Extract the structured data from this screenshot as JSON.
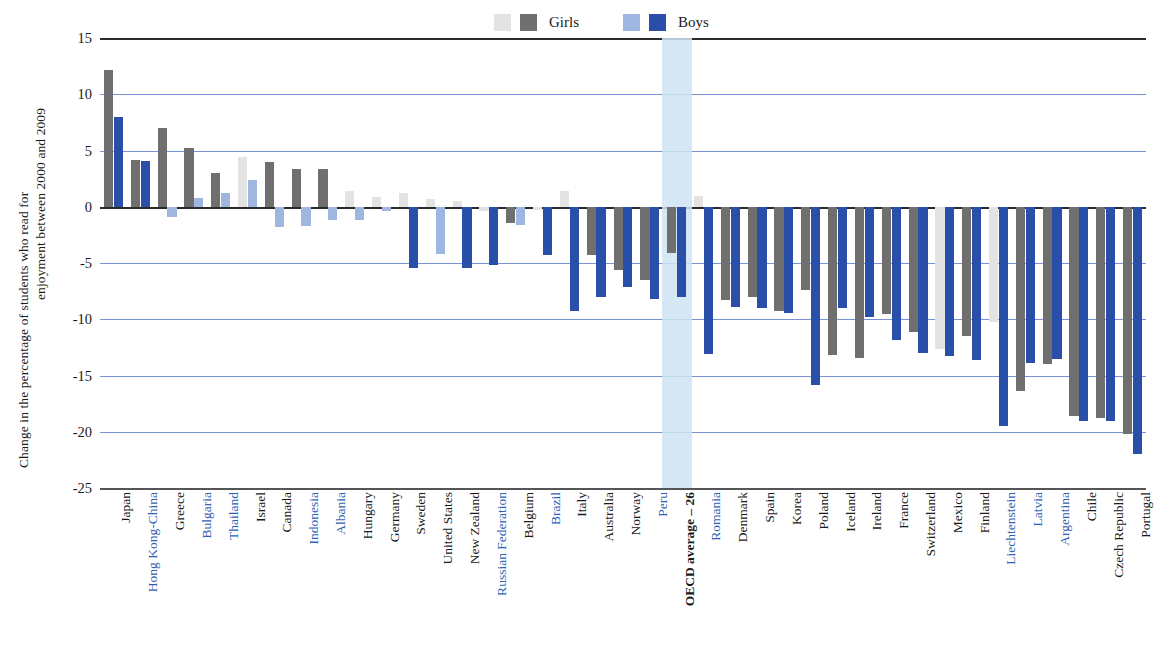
{
  "axis_title": {
    "line1": "Change in the percentage of students who read for",
    "line2": "enjoyment between 2000 and 2009"
  },
  "legend": [
    {
      "label": "Girls",
      "swatch_light": "#e3e3e3",
      "swatch_dark": "#6f6f6f"
    },
    {
      "label": "Boys",
      "swatch_light": "#9fb6e0",
      "swatch_dark": "#2a4fa8"
    }
  ],
  "colors": {
    "girls_significant": "#6f6f6f",
    "girls_not_significant": "#e3e3e3",
    "boys_significant": "#2a4fa8",
    "boys_not_significant": "#9fb6e0",
    "gridline": "#4a6fc4",
    "zero_axis": "#2b2b2b",
    "highlight_band": "#cfe3f5",
    "non_oecd_label": "#2f62b5"
  },
  "y_axis": {
    "ticks": [
      "15",
      "10",
      "5",
      "0",
      "-5",
      "-10",
      "-15",
      "-20",
      "-25"
    ],
    "values": [
      15,
      10,
      5,
      0,
      -5,
      -10,
      -15,
      -20,
      -25
    ],
    "min": -25,
    "max": 15
  },
  "chart_data": {
    "type": "bar",
    "title": "",
    "xlabel": "",
    "ylabel": "Change in the percentage of students who read for enjoyment between 2000 and 2009",
    "ylim": [
      -25,
      15
    ],
    "grid": true,
    "legend_position": "top-center",
    "categories": [
      "Japan",
      "Hong Kong-China",
      "Greece",
      "Bulgaria",
      "Thailand",
      "Israel",
      "Canada",
      "Indonesia",
      "Albania",
      "Hungary",
      "Germany",
      "Sweden",
      "United States",
      "New Zealand",
      "Russian Federation",
      "Belgium",
      "Brazil",
      "Italy",
      "Australia",
      "Norway",
      "Peru",
      "OECD average – 26",
      "Romania",
      "Denmark",
      "Spain",
      "Korea",
      "Poland",
      "Iceland",
      "Ireland",
      "France",
      "Switzerland",
      "Mexico",
      "Finland",
      "Liechtenstein",
      "Latvia",
      "Argentina",
      "Chile",
      "Czech Republic",
      "Portugal"
    ],
    "non_oecd": [
      "Hong Kong-China",
      "Bulgaria",
      "Thailand",
      "Indonesia",
      "Albania",
      "Russian Federation",
      "Brazil",
      "Peru",
      "Romania",
      "Liechtenstein",
      "Latvia",
      "Argentina"
    ],
    "highlighted_category": "OECD average – 26",
    "series": [
      {
        "name": "Girls",
        "values": [
          12.2,
          4.2,
          7.0,
          5.2,
          3.0,
          4.4,
          4.0,
          3.4,
          3.4,
          1.4,
          0.9,
          1.2,
          0.7,
          0.5,
          -0.4,
          -1.4,
          -0.3,
          1.4,
          -4.3,
          -5.6,
          -6.5,
          -4.1,
          1.0,
          -8.3,
          -8.0,
          -9.3,
          -7.4,
          -13.2,
          -13.4,
          -9.5,
          -11.1,
          -12.6,
          -11.5,
          -10.2,
          -16.4,
          -14.0,
          -18.6,
          -18.8,
          -20.2
        ],
        "significant": [
          true,
          true,
          true,
          true,
          true,
          false,
          true,
          true,
          true,
          false,
          false,
          false,
          false,
          false,
          false,
          true,
          false,
          false,
          true,
          true,
          true,
          true,
          false,
          true,
          true,
          true,
          true,
          true,
          true,
          true,
          true,
          false,
          true,
          false,
          true,
          true,
          true,
          true,
          true
        ]
      },
      {
        "name": "Boys",
        "values": [
          8.0,
          4.1,
          -0.9,
          0.8,
          1.2,
          2.4,
          -1.8,
          -1.7,
          -1.2,
          -1.2,
          -0.4,
          -5.4,
          -4.2,
          -5.4,
          -5.2,
          -1.6,
          -4.3,
          -9.3,
          -8.0,
          -7.1,
          -8.2,
          -8.0,
          -13.1,
          -8.9,
          -9.0,
          -9.4,
          -15.8,
          -9.0,
          -9.8,
          -11.8,
          -13.0,
          -13.3,
          -13.6,
          -19.5,
          -13.9,
          -13.5,
          -19.0,
          -19.0,
          -22.0
        ],
        "significant": [
          true,
          true,
          false,
          false,
          false,
          false,
          false,
          false,
          false,
          false,
          false,
          true,
          false,
          true,
          true,
          false,
          true,
          true,
          true,
          true,
          true,
          true,
          true,
          true,
          true,
          true,
          true,
          true,
          true,
          true,
          true,
          true,
          true,
          true,
          true,
          true,
          true,
          true,
          true
        ]
      }
    ]
  }
}
